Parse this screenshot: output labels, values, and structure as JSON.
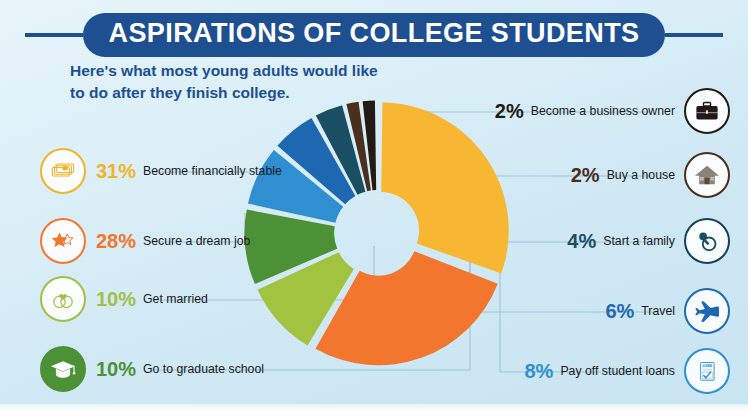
{
  "header": {
    "title": "ASPIRATIONS OF COLLEGE STUDENTS",
    "subtitle_line1": "Here's what most young adults would like",
    "subtitle_line2": "to do after they finish college.",
    "title_bg": "#1d4f91",
    "subtitle_color": "#1d4f91"
  },
  "left_callouts": [
    {
      "pct": "31%",
      "label": "Become financially stable",
      "icon": "money-icon",
      "color": "#f0b429",
      "ring": "#f0b429",
      "filled": false
    },
    {
      "pct": "28%",
      "label": "Secure a dream job",
      "icon": "star-icon",
      "color": "#f2762e",
      "ring": "#f2762e",
      "filled": false
    },
    {
      "pct": "10%",
      "label": "Get married",
      "icon": "wedding-rings-icon",
      "color": "#a2bf46",
      "ring": "#a2bf46",
      "filled": false
    },
    {
      "pct": "10%",
      "label": "Go to graduate school",
      "icon": "graduation-cap-icon",
      "color": "#4d9137",
      "ring": "#4d9137",
      "filled": true
    }
  ],
  "right_callouts": [
    {
      "pct": "2%",
      "label": "Become a business owner",
      "icon": "briefcase-icon",
      "color": "#231a15",
      "ring": "#231a15",
      "filled": false
    },
    {
      "pct": "2%",
      "label": "Buy a house",
      "icon": "house-icon",
      "color": "#4a2e1e",
      "ring": "#4a2e1e",
      "filled": false
    },
    {
      "pct": "4%",
      "label": "Start a family",
      "icon": "pacifier-icon",
      "color": "#1a4f63",
      "ring": "#17415a",
      "filled": false
    },
    {
      "pct": "6%",
      "label": "Travel",
      "icon": "airplane-icon",
      "color": "#1d68b0",
      "ring": "#1d68b0",
      "filled": false
    },
    {
      "pct": "8%",
      "label": "Pay off student loans",
      "icon": "loan-document-icon",
      "color": "#2f8fd0",
      "ring": "#2f8fd0",
      "filled": false
    }
  ],
  "chart_data": {
    "type": "pie",
    "title": "Aspirations of College Students",
    "variant": "exploded-donut",
    "inner_radius_pct": 30,
    "start_angle_deg": 0,
    "grid": false,
    "legend": "callouts-left-and-right",
    "categories": [
      "Become financially stable",
      "Secure a dream job",
      "Get married",
      "Go to graduate school",
      "Pay off student loans",
      "Travel",
      "Start a family",
      "Buy a house",
      "Become a business owner"
    ],
    "values": [
      31,
      28,
      10,
      10,
      8,
      6,
      4,
      2,
      2
    ],
    "labels": [
      "31%",
      "28%",
      "10%",
      "10%",
      "8%",
      "6%",
      "4%",
      "2%",
      "2%"
    ],
    "colors": [
      "#f7b733",
      "#f2762e",
      "#a2c33f",
      "#4d9137",
      "#2f8fd0",
      "#1d68b0",
      "#1a4f63",
      "#4a2e1e",
      "#231a15"
    ],
    "total": 101
  }
}
